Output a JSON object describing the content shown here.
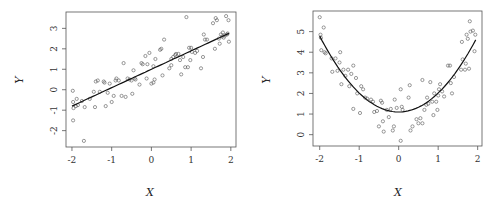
{
  "chart_data": [
    {
      "type": "scatter",
      "title": "",
      "xlabel": "X",
      "ylabel": "Y",
      "xlim": [
        -2.15,
        2.13
      ],
      "ylim": [
        -2.8,
        3.8
      ],
      "xticks": [
        -2,
        -1,
        0,
        1,
        2
      ],
      "yticks": [
        -2,
        -1,
        0,
        1,
        2,
        3
      ],
      "grid": false,
      "fit_line": {
        "type": "linear",
        "intercept": 1.0,
        "slope": 0.9,
        "x_range": [
          -2,
          1.95
        ]
      },
      "points": [
        [
          -1.98,
          -0.05
        ],
        [
          -1.97,
          -0.6
        ],
        [
          -1.96,
          -0.9
        ],
        [
          -1.97,
          -1.5
        ],
        [
          -1.88,
          -0.45
        ],
        [
          -1.85,
          -0.75
        ],
        [
          -1.9,
          -0.8
        ],
        [
          -1.75,
          -0.55
        ],
        [
          -1.68,
          -0.85
        ],
        [
          -1.7,
          -2.5
        ],
        [
          -1.55,
          -0.45
        ],
        [
          -1.45,
          -0.1
        ],
        [
          -1.42,
          -0.85
        ],
        [
          -1.4,
          0.4
        ],
        [
          -1.35,
          0.45
        ],
        [
          -1.3,
          -0.1
        ],
        [
          -1.2,
          0.4
        ],
        [
          -1.18,
          0.35
        ],
        [
          -1.15,
          -0.8
        ],
        [
          -1.1,
          -0.15
        ],
        [
          -1.05,
          0.3
        ],
        [
          -1.0,
          -0.6
        ],
        [
          -0.95,
          -0.3
        ],
        [
          -0.9,
          0.45
        ],
        [
          -0.88,
          0.55
        ],
        [
          -0.82,
          0.45
        ],
        [
          -0.75,
          -0.3
        ],
        [
          -0.7,
          1.3
        ],
        [
          -0.65,
          -0.35
        ],
        [
          -0.6,
          0.55
        ],
        [
          -0.55,
          0.5
        ],
        [
          -0.5,
          0.45
        ],
        [
          -0.48,
          -0.2
        ],
        [
          -0.45,
          0.95
        ],
        [
          -0.42,
          0.55
        ],
        [
          -0.4,
          0.5
        ],
        [
          -0.3,
          0.25
        ],
        [
          -0.25,
          1.3
        ],
        [
          -0.22,
          1.25
        ],
        [
          -0.15,
          1.65
        ],
        [
          -0.12,
          0.55
        ],
        [
          -0.1,
          1.25
        ],
        [
          -0.05,
          1.8
        ],
        [
          0.0,
          0.3
        ],
        [
          0.05,
          0.35
        ],
        [
          0.05,
          1.15
        ],
        [
          0.08,
          0.5
        ],
        [
          0.1,
          1.5
        ],
        [
          0.22,
          1.95
        ],
        [
          0.25,
          2.0
        ],
        [
          0.28,
          0.7
        ],
        [
          0.32,
          2.45
        ],
        [
          0.45,
          1.05
        ],
        [
          0.5,
          1.2
        ],
        [
          0.5,
          1.5
        ],
        [
          0.55,
          1.6
        ],
        [
          0.6,
          1.7
        ],
        [
          0.62,
          1.75
        ],
        [
          0.68,
          1.75
        ],
        [
          0.72,
          1.45
        ],
        [
          0.75,
          0.75
        ],
        [
          0.8,
          1.6
        ],
        [
          0.85,
          1.1
        ],
        [
          0.88,
          3.55
        ],
        [
          0.92,
          1.1
        ],
        [
          0.95,
          2.05
        ],
        [
          0.98,
          1.45
        ],
        [
          1.0,
          2.05
        ],
        [
          1.02,
          1.85
        ],
        [
          1.1,
          1.8
        ],
        [
          1.15,
          1.9
        ],
        [
          1.25,
          1.05
        ],
        [
          1.3,
          1.6
        ],
        [
          1.32,
          2.7
        ],
        [
          1.35,
          2.45
        ],
        [
          1.4,
          2.45
        ],
        [
          1.55,
          3.25
        ],
        [
          1.6,
          2.0
        ],
        [
          1.62,
          3.5
        ],
        [
          1.65,
          3.4
        ],
        [
          1.7,
          2.5
        ],
        [
          1.72,
          2.25
        ],
        [
          1.75,
          2.7
        ],
        [
          1.78,
          2.6
        ],
        [
          1.8,
          2.8
        ],
        [
          1.82,
          2.55
        ],
        [
          1.85,
          2.65
        ],
        [
          1.88,
          3.6
        ],
        [
          1.9,
          2.7
        ],
        [
          1.92,
          2.75
        ],
        [
          1.94,
          3.4
        ],
        [
          1.95,
          2.35
        ]
      ]
    },
    {
      "type": "scatter",
      "title": "",
      "xlabel": "X",
      "ylabel": "Y",
      "xlim": [
        -2.17,
        2.11
      ],
      "ylim": [
        -0.55,
        6.0
      ],
      "xticks": [
        -2,
        -1,
        0,
        1,
        2
      ],
      "yticks": [
        0,
        1,
        2,
        3,
        4,
        5
      ],
      "grid": false,
      "fit_line": {
        "type": "quadratic",
        "a": 0.92,
        "b": 0.0,
        "c": 1.1,
        "x_range": [
          -2,
          1.95
        ]
      },
      "points": [
        [
          -2.0,
          5.7
        ],
        [
          -1.98,
          4.85
        ],
        [
          -1.97,
          4.7
        ],
        [
          -1.96,
          4.1
        ],
        [
          -1.9,
          5.2
        ],
        [
          -1.88,
          4.0
        ],
        [
          -1.85,
          3.95
        ],
        [
          -1.7,
          3.7
        ],
        [
          -1.68,
          3.05
        ],
        [
          -1.6,
          3.7
        ],
        [
          -1.55,
          3.1
        ],
        [
          -1.5,
          3.5
        ],
        [
          -1.48,
          4.0
        ],
        [
          -1.45,
          2.45
        ],
        [
          -1.4,
          3.15
        ],
        [
          -1.35,
          2.85
        ],
        [
          -1.28,
          3.15
        ],
        [
          -1.25,
          2.35
        ],
        [
          -1.2,
          2.95
        ],
        [
          -1.15,
          3.35
        ],
        [
          -1.15,
          1.25
        ],
        [
          -1.08,
          2.75
        ],
        [
          -1.05,
          2.0
        ],
        [
          -0.98,
          1.05
        ],
        [
          -0.95,
          2.35
        ],
        [
          -0.9,
          2.2
        ],
        [
          -0.85,
          1.8
        ],
        [
          -0.8,
          1.75
        ],
        [
          -0.7,
          1.7
        ],
        [
          -0.65,
          1.6
        ],
        [
          -0.62,
          1.1
        ],
        [
          -0.55,
          1.15
        ],
        [
          -0.5,
          0.4
        ],
        [
          -0.45,
          1.65
        ],
        [
          -0.42,
          1.55
        ],
        [
          -0.4,
          0.65
        ],
        [
          -0.38,
          0.15
        ],
        [
          -0.3,
          1.2
        ],
        [
          -0.25,
          0.85
        ],
        [
          -0.2,
          1.25
        ],
        [
          -0.15,
          0.2
        ],
        [
          -0.12,
          0.4
        ],
        [
          -0.1,
          1.7
        ],
        [
          -0.05,
          1.3
        ],
        [
          0.05,
          -0.3
        ],
        [
          0.05,
          2.2
        ],
        [
          0.08,
          1.35
        ],
        [
          0.1,
          1.2
        ],
        [
          0.25,
          1.8
        ],
        [
          0.28,
          2.4
        ],
        [
          0.3,
          0.2
        ],
        [
          0.35,
          0.4
        ],
        [
          0.45,
          0.75
        ],
        [
          0.5,
          0.55
        ],
        [
          0.55,
          0.8
        ],
        [
          0.6,
          0.55
        ],
        [
          0.6,
          2.65
        ],
        [
          0.65,
          1.2
        ],
        [
          0.7,
          1.45
        ],
        [
          0.72,
          1.8
        ],
        [
          0.75,
          1.5
        ],
        [
          0.8,
          2.55
        ],
        [
          0.85,
          1.6
        ],
        [
          0.88,
          0.95
        ],
        [
          0.9,
          2.0
        ],
        [
          0.95,
          1.6
        ],
        [
          0.98,
          1.2
        ],
        [
          1.0,
          1.9
        ],
        [
          1.02,
          2.2
        ],
        [
          1.05,
          2.45
        ],
        [
          1.1,
          2.1
        ],
        [
          1.15,
          1.85
        ],
        [
          1.25,
          3.35
        ],
        [
          1.3,
          3.35
        ],
        [
          1.32,
          2.5
        ],
        [
          1.35,
          2.0
        ],
        [
          1.4,
          2.8
        ],
        [
          1.58,
          3.15
        ],
        [
          1.6,
          4.5
        ],
        [
          1.62,
          3.65
        ],
        [
          1.68,
          3.15
        ],
        [
          1.7,
          3.45
        ],
        [
          1.72,
          4.85
        ],
        [
          1.75,
          4.65
        ],
        [
          1.78,
          3.2
        ],
        [
          1.8,
          5.5
        ],
        [
          1.82,
          5.0
        ],
        [
          1.88,
          5.05
        ],
        [
          1.92,
          4.05
        ],
        [
          1.94,
          4.85
        ]
      ]
    }
  ],
  "plots": [
    {
      "xlabel": "X",
      "ylabel": "Y"
    },
    {
      "xlabel": "X",
      "ylabel": "Y"
    }
  ],
  "colors": {
    "points": "#555555",
    "line": "#111111",
    "frame": "#555555",
    "text": "#333333"
  }
}
